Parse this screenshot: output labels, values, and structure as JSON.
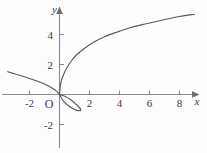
{
  "figure": {
    "background_color": "#fdfdfd",
    "curve_color": "#5a5a5a",
    "axis_color": "#8a8a8a",
    "text_color": "#3a3a3a",
    "origin_label": "O"
  },
  "chart_data": {
    "type": "line",
    "title": "",
    "xlabel": "x",
    "ylabel": "y",
    "xlim": [
      -3.9,
      9.6
    ],
    "ylim": [
      -3.9,
      6.2
    ],
    "grid": false,
    "legend": null,
    "x_ticks": [
      -2,
      2,
      4,
      6,
      8
    ],
    "x_tick_labels": [
      "-2",
      "2",
      "4",
      "6",
      "8"
    ],
    "y_ticks": [
      -2,
      2,
      4
    ],
    "y_tick_labels": [
      "-2",
      "2",
      "4"
    ],
    "origin_tick_label": "O",
    "annotations": [],
    "series": [
      {
        "name": "upper-branch",
        "comment": "rises from origin like a square-root / cubic branch",
        "x": [
          0.0,
          0.05,
          0.15,
          0.3,
          0.5,
          0.8,
          1.2,
          1.7,
          2.3,
          3.0,
          3.8,
          4.7,
          5.7,
          6.8,
          8.0,
          9.0
        ],
        "y": [
          0.0,
          0.55,
          1.0,
          1.4,
          1.8,
          2.25,
          2.7,
          3.1,
          3.5,
          3.85,
          4.15,
          4.45,
          4.7,
          4.95,
          5.2,
          5.35
        ]
      },
      {
        "name": "loop-branch",
        "comment": "closed loop to the right of the origin dipping below the x axis",
        "x": [
          0.0,
          0.35,
          0.75,
          1.1,
          1.35,
          1.42,
          1.3,
          1.0,
          0.6,
          0.25,
          0.0
        ],
        "y": [
          0.0,
          -0.12,
          -0.35,
          -0.65,
          -0.9,
          -1.02,
          -1.08,
          -1.0,
          -0.75,
          -0.42,
          0.0
        ]
      },
      {
        "name": "left-branch",
        "comment": "straightish branch arriving from the upper-left into the origin",
        "x": [
          -3.45,
          -3.0,
          -2.4,
          -1.8,
          -1.2,
          -0.7,
          -0.3,
          -0.08,
          0.0
        ],
        "y": [
          1.52,
          1.38,
          1.2,
          1.0,
          0.78,
          0.55,
          0.3,
          0.1,
          0.0
        ]
      }
    ]
  }
}
